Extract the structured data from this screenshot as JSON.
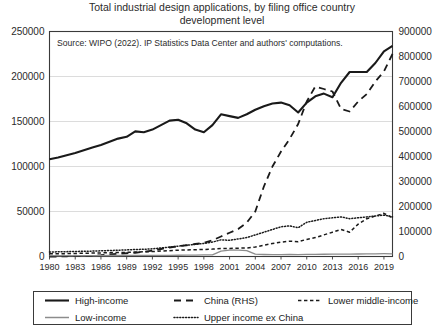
{
  "chart_data": {
    "type": "line",
    "title": "Total industrial design applications, by filing office country development level",
    "title_line1": "Total industrial design applications, by filing office country",
    "title_line2": "development level",
    "annotation": "Source: WIPO (2022). IP Statistics Data Center and authors' computations.",
    "xlabel": "",
    "ylabel": "",
    "ylabel_right": "",
    "grid": true,
    "legend_position": "below",
    "xlim": [
      1980,
      2020
    ],
    "ylim": [
      0,
      250000
    ],
    "ylim_right": [
      0,
      900000
    ],
    "yticks": [
      0,
      50000,
      100000,
      150000,
      200000,
      250000
    ],
    "yticks_right": [
      0,
      100000,
      200000,
      300000,
      400000,
      500000,
      600000,
      700000,
      800000,
      900000
    ],
    "ytick_labels": [
      "0",
      "50000",
      "100000",
      "150000",
      "200000",
      "250000"
    ],
    "ytick_labels_right": [
      "0",
      "100000",
      "200000",
      "300000",
      "400000",
      "500000",
      "600000",
      "700000",
      "800000",
      "900000"
    ],
    "x": [
      1980,
      1981,
      1982,
      1983,
      1984,
      1985,
      1986,
      1987,
      1988,
      1989,
      1990,
      1991,
      1992,
      1993,
      1994,
      1995,
      1996,
      1997,
      1998,
      1999,
      2000,
      2001,
      2002,
      2003,
      2004,
      2005,
      2006,
      2007,
      2008,
      2009,
      2010,
      2011,
      2012,
      2013,
      2014,
      2015,
      2016,
      2017,
      2018,
      2019,
      2020
    ],
    "xticks": [
      1980,
      1983,
      1986,
      1989,
      1992,
      1995,
      1998,
      2001,
      2004,
      2007,
      2010,
      2013,
      2016,
      2019
    ],
    "xtick_labels": [
      "1980",
      "1983",
      "1986",
      "1989",
      "1992",
      "1995",
      "1998",
      "2001",
      "2004",
      "2007",
      "2010",
      "2013",
      "2016",
      "2019"
    ],
    "series": [
      {
        "name": "High-income",
        "axis": "left",
        "style": "solid",
        "color": "#1a1a1a",
        "width": 2.1,
        "values": [
          108000,
          110000,
          112500,
          115000,
          118000,
          121000,
          124000,
          127500,
          131000,
          133000,
          139000,
          138000,
          141000,
          146000,
          151000,
          152000,
          148000,
          141000,
          138000,
          146000,
          158000,
          156000,
          154000,
          158000,
          163000,
          167000,
          170000,
          171000,
          168000,
          160000,
          171000,
          178000,
          181000,
          177000,
          193000,
          205000,
          205000,
          205000,
          215000,
          228000,
          234000
        ]
      },
      {
        "name": "China (RHS)",
        "axis": "right",
        "style": "dashed",
        "color": "#1a1a1a",
        "width": 1.8,
        "values": [
          0,
          0,
          1000,
          1500,
          2000,
          3000,
          5000,
          8000,
          11000,
          13000,
          15000,
          19000,
          24000,
          30000,
          36000,
          41000,
          45000,
          50000,
          55000,
          65000,
          80000,
          95000,
          110000,
          135000,
          180000,
          280000,
          360000,
          420000,
          470000,
          530000,
          620000,
          680000,
          670000,
          660000,
          590000,
          580000,
          620000,
          650000,
          700000,
          740000,
          810000
        ]
      },
      {
        "name": "Lower middle-income",
        "axis": "left",
        "style": "dashed-short",
        "color": "#1a1a1a",
        "width": 1.5,
        "values": [
          3000,
          3000,
          3200,
          3400,
          3600,
          3800,
          4000,
          4200,
          4500,
          4600,
          5000,
          5200,
          5500,
          6000,
          6500,
          7000,
          7300,
          7500,
          7800,
          8200,
          9000,
          9000,
          9200,
          9500,
          10500,
          12500,
          14500,
          16000,
          17000,
          16500,
          19000,
          21000,
          24000,
          27000,
          30000,
          27000,
          36000,
          42000,
          45000,
          48000,
          43000
        ]
      },
      {
        "name": "Upper income ex China",
        "axis": "left",
        "style": "dotted",
        "color": "#1a1a1a",
        "width": 1.5,
        "values": [
          5000,
          5200,
          5400,
          5600,
          5800,
          6000,
          6300,
          6600,
          7000,
          7300,
          7800,
          8000,
          8500,
          9500,
          10500,
          11500,
          12500,
          13500,
          14500,
          16000,
          18500,
          18000,
          19500,
          21000,
          24000,
          27000,
          30000,
          33000,
          34000,
          32000,
          38000,
          40000,
          42000,
          43000,
          44000,
          42000,
          43000,
          44000,
          45000,
          46000,
          44000
        ]
      },
      {
        "name": "Low-income",
        "axis": "left",
        "style": "solid",
        "color": "#8c8c8c",
        "width": 1.3,
        "values": [
          900,
          900,
          950,
          950,
          1000,
          1000,
          1050,
          1100,
          1100,
          1150,
          1200,
          1200,
          1250,
          1300,
          1350,
          1400,
          1500,
          1600,
          1700,
          1900,
          6000,
          7200,
          7000,
          6600,
          2600,
          2200,
          2000,
          2100,
          2200,
          2100,
          2300,
          2400,
          2500,
          2600,
          2700,
          2700,
          2800,
          2900,
          3000,
          3100,
          3000
        ]
      }
    ]
  },
  "legend": {
    "items": [
      {
        "label": "High-income",
        "style": "solid",
        "color": "#1a1a1a",
        "row": 0,
        "col": 0
      },
      {
        "label": "China (RHS)",
        "style": "dashed",
        "color": "#1a1a1a",
        "row": 0,
        "col": 1
      },
      {
        "label": "Lower middle-income",
        "style": "dashed-short",
        "color": "#1a1a1a",
        "row": 0,
        "col": 2
      },
      {
        "label": "Low-income",
        "style": "solid-gray",
        "color": "#8c8c8c",
        "row": 1,
        "col": 0
      },
      {
        "label": "Upper income ex China",
        "style": "dotted",
        "color": "#1a1a1a",
        "row": 1,
        "col": 1
      }
    ]
  },
  "colors": {
    "axis": "#3a3a3a",
    "grid": "#d8d8d8",
    "text": "#2b2b2b",
    "high_income": "#1a1a1a",
    "low_income": "#8c8c8c"
  }
}
